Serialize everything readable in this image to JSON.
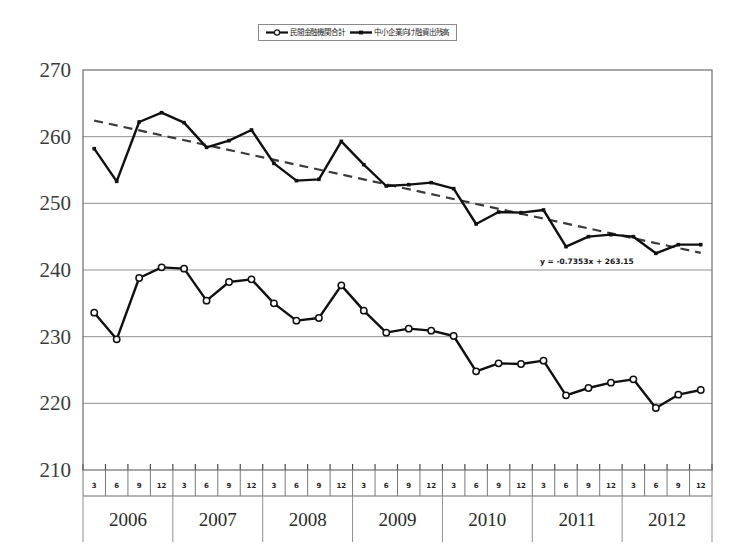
{
  "legend": {
    "position": "top-center",
    "entries": [
      {
        "label": "民間金融機関合計",
        "marker": "open-circle-line",
        "icon": "legend-marker-open-circle"
      },
      {
        "label": "中小企業向け融資出残高",
        "marker": "solid-line",
        "icon": "legend-marker-solid-line"
      }
    ]
  },
  "axes": {
    "y_ticks": [
      "210",
      "220",
      "230",
      "240",
      "250",
      "260",
      "270"
    ],
    "years": [
      "2006",
      "2007",
      "2008",
      "2009",
      "2010",
      "2011",
      "2012"
    ],
    "quarters": [
      "3",
      "6",
      "9",
      "12"
    ]
  },
  "trend": {
    "equation": "y = -0.7353x + 263.15",
    "slope": -0.7353,
    "intercept": 263.15,
    "style": "dashed"
  },
  "chart_data": {
    "type": "line",
    "title": "",
    "subtitle": "",
    "xlabel": "",
    "ylabel": "",
    "ylim": [
      210,
      270
    ],
    "ytick_step": 10,
    "grid": true,
    "legend_position": "top-center",
    "categories": [
      "2006/3",
      "2006/6",
      "2006/9",
      "2006/12",
      "2007/3",
      "2007/6",
      "2007/9",
      "2007/12",
      "2008/3",
      "2008/6",
      "2008/9",
      "2008/12",
      "2009/3",
      "2009/6",
      "2009/9",
      "2009/12",
      "2010/3",
      "2010/6",
      "2010/9",
      "2010/12",
      "2011/3",
      "2011/6",
      "2011/9",
      "2011/12",
      "2012/3",
      "2012/6",
      "2012/9",
      "2012/12"
    ],
    "series": [
      {
        "name": "中小企業向け融資出残高",
        "marker": "small-solid",
        "values": [
          258.2,
          253.3,
          262.2,
          263.6,
          262.1,
          258.4,
          259.4,
          261.0,
          256.0,
          253.4,
          253.6,
          259.3,
          255.8,
          252.6,
          252.8,
          253.1,
          252.2,
          246.9,
          248.7,
          248.6,
          249.0,
          243.5,
          245.0,
          245.3,
          245.0,
          242.5,
          243.8,
          243.8
        ]
      },
      {
        "name": "民間金融機関合計",
        "marker": "open-circle",
        "values": [
          233.6,
          229.6,
          238.8,
          240.4,
          240.2,
          235.4,
          238.2,
          238.6,
          235.0,
          232.4,
          232.8,
          237.7,
          233.9,
          230.6,
          231.2,
          230.9,
          230.1,
          224.8,
          226.0,
          225.9,
          226.4,
          221.2,
          222.3,
          223.1,
          223.6,
          219.3,
          221.3,
          222.0
        ]
      }
    ],
    "trendline": {
      "applies_to": "中小企業向け融資出残高",
      "equation": "y = -0.7353x + 263.15",
      "style": "dashed",
      "x_start": 1,
      "x_end": 28
    }
  }
}
